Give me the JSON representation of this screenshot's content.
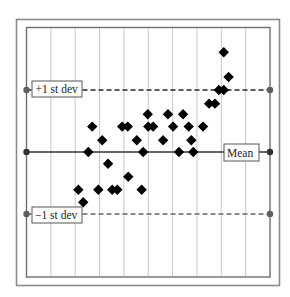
{
  "chart_data": {
    "type": "scatter",
    "title": "",
    "xlabel": "",
    "ylabel": "",
    "grid": {
      "vertical_lines": 9,
      "horizontal": false
    },
    "x_range": [
      0,
      10
    ],
    "y_range": [
      -2,
      2
    ],
    "reference_lines": [
      {
        "name": "+1 st dev",
        "label": "+1 st dev",
        "value": 1,
        "style": "dashed",
        "color": "#5a5a5a"
      },
      {
        "name": "Mean",
        "label": "Mean",
        "value": 0,
        "style": "solid",
        "color": "#333333"
      },
      {
        "name": "-1 st dev",
        "label": "−1 st dev",
        "value": -1,
        "style": "dashed",
        "color": "#8a8a8a"
      }
    ],
    "series": [
      {
        "name": "observations",
        "marker": "diamond",
        "color": "#000000",
        "points": [
          {
            "x": 2.13,
            "y": -0.61
          },
          {
            "x": 2.33,
            "y": -0.81
          },
          {
            "x": 2.54,
            "y": 0.0
          },
          {
            "x": 2.7,
            "y": 0.41
          },
          {
            "x": 2.95,
            "y": -0.61
          },
          {
            "x": 3.11,
            "y": 0.19
          },
          {
            "x": 3.35,
            "y": -0.19
          },
          {
            "x": 3.52,
            "y": -0.61
          },
          {
            "x": 3.73,
            "y": -0.61
          },
          {
            "x": 3.93,
            "y": 0.41
          },
          {
            "x": 4.16,
            "y": 0.41
          },
          {
            "x": 4.18,
            "y": -0.4
          },
          {
            "x": 4.53,
            "y": 0.19
          },
          {
            "x": 4.73,
            "y": -0.61
          },
          {
            "x": 4.79,
            "y": 0.0
          },
          {
            "x": 4.98,
            "y": 0.61
          },
          {
            "x": 5.0,
            "y": 0.41
          },
          {
            "x": 5.2,
            "y": 0.41
          },
          {
            "x": 5.61,
            "y": 0.19
          },
          {
            "x": 5.81,
            "y": 0.61
          },
          {
            "x": 6.02,
            "y": 0.41
          },
          {
            "x": 6.26,
            "y": 0.0
          },
          {
            "x": 6.43,
            "y": 0.61
          },
          {
            "x": 6.66,
            "y": 0.41
          },
          {
            "x": 6.77,
            "y": 0.19
          },
          {
            "x": 6.85,
            "y": 0.0
          },
          {
            "x": 7.25,
            "y": 0.41
          },
          {
            "x": 7.5,
            "y": 0.78
          },
          {
            "x": 7.74,
            "y": 0.78
          },
          {
            "x": 7.9,
            "y": 1.0
          },
          {
            "x": 8.1,
            "y": 1.0
          },
          {
            "x": 8.3,
            "y": 1.21
          },
          {
            "x": 8.1,
            "y": 1.61
          }
        ]
      }
    ]
  },
  "labels": {
    "plus_one": "+1 st dev",
    "mean": "Mean",
    "minus_one": "−1 st dev"
  },
  "colors": {
    "frame": "#8c8c8c",
    "inner_border": "#6e6e6e",
    "grid": "#c8c8c8",
    "mean_line": "#333333",
    "plus_line": "#5a5a5a",
    "minus_line": "#8a8a8a",
    "marker": "#000000",
    "endpoint": "#5e5e5e"
  }
}
